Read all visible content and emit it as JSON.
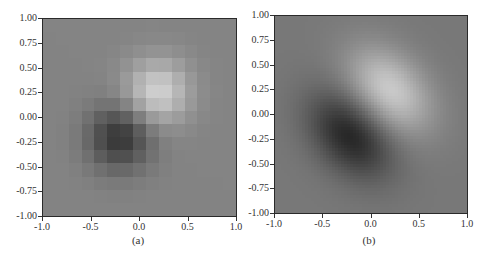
{
  "figure": {
    "captions": [
      "(a)",
      "(b)"
    ]
  },
  "chart_data": [
    {
      "type": "heatmap",
      "title": "",
      "caption": "(a)",
      "xlabel": "",
      "ylabel": "",
      "xlim": [
        -1.0,
        1.0
      ],
      "ylim": [
        -1.0,
        1.0
      ],
      "x_ticks": [
        "-1.0",
        "-0.5",
        "0.0",
        "0.5",
        "1.0"
      ],
      "y_ticks": [
        "1.00",
        "0.75",
        "0.50",
        "0.25",
        "0.00",
        "-0.25",
        "-0.50",
        "-0.75",
        "-1.00"
      ],
      "colormap": "gray",
      "interpolation": "nearest",
      "grid_resolution": 15,
      "function": "z = exp(-((x-0.2)^2+(y-0.28)^2)/0.12) - exp(-((x+0.22)^2+(y+0.22)^2)/0.12)",
      "components": [
        {
          "sign": 1,
          "cx": 0.2,
          "cy": 0.28,
          "sxx": 0.12,
          "syy": 0.12,
          "sxy": 0.0
        },
        {
          "sign": -1,
          "cx": -0.22,
          "cy": -0.22,
          "sxx": 0.12,
          "syy": 0.12,
          "sxy": 0.0
        }
      ],
      "value_range": [
        -1.0,
        1.0
      ],
      "gray_range": [
        58,
        205
      ],
      "peak": {
        "x": 0.2,
        "y": 0.28,
        "value": "max"
      },
      "trough": {
        "x": -0.22,
        "y": -0.22,
        "value": "min"
      }
    },
    {
      "type": "heatmap",
      "title": "",
      "caption": "(b)",
      "xlabel": "",
      "ylabel": "",
      "xlim": [
        -1.0,
        1.0
      ],
      "ylim": [
        -1.0,
        1.0
      ],
      "x_ticks": [
        "-1.0",
        "-0.5",
        "0.0",
        "0.5",
        "1.0"
      ],
      "y_ticks": [
        "1.00",
        "0.75",
        "0.50",
        "0.25",
        "0.00",
        "-0.25",
        "-0.50",
        "-0.75",
        "-1.00"
      ],
      "colormap": "gray",
      "interpolation": "bilinear",
      "grid_resolution": 64,
      "function": "z = exp(-Q(x-0.2,y-0.25)) - exp(-Q(x+0.22,y+0.22)), Q anisotropic (elongated along -45deg)",
      "components": [
        {
          "sign": 1,
          "cx": 0.2,
          "cy": 0.25,
          "sxx": 0.16,
          "syy": 0.16,
          "sxy": 0.06
        },
        {
          "sign": -1,
          "cx": -0.22,
          "cy": -0.22,
          "sxx": 0.16,
          "syy": 0.16,
          "sxy": 0.06
        }
      ],
      "value_range": [
        -1.0,
        1.0
      ],
      "gray_range": [
        40,
        200
      ],
      "peak": {
        "x": 0.2,
        "y": 0.25,
        "value": "max"
      },
      "trough": {
        "x": -0.22,
        "y": -0.22,
        "value": "min"
      }
    }
  ]
}
